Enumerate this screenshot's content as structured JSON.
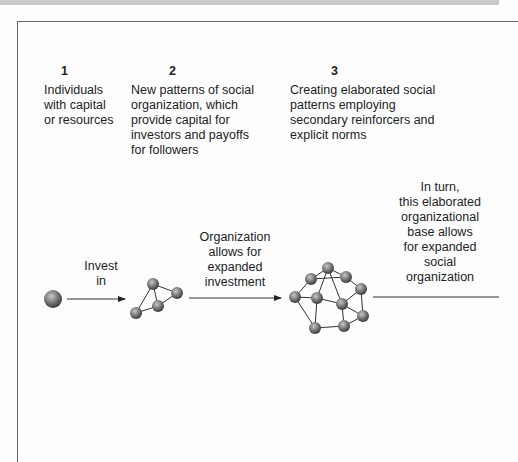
{
  "stages": [
    {
      "number": "1",
      "description": "Individuals with capital or resources",
      "lines": [
        "Individuals",
        "with capital",
        "or resources"
      ]
    },
    {
      "number": "2",
      "description": "New patterns of social organization, which provide capital for investors and payoffs for followers",
      "lines": [
        "New patterns of social",
        "organization, which",
        "provide capital for",
        "investors and payoffs",
        "for followers"
      ]
    },
    {
      "number": "3",
      "description": "Creating elaborated social patterns employing secondary reinforcers and explicit norms",
      "lines": [
        "Creating elaborated social",
        "patterns employing",
        "secondary reinforcers and",
        "explicit norms"
      ]
    }
  ],
  "arrows": [
    {
      "label_lines": [
        "Invest",
        "in"
      ]
    },
    {
      "label_lines": [
        "Organization",
        "allows for",
        "expanded",
        "investment"
      ]
    },
    {
      "label_lines": [
        "In turn,",
        "this elaborated",
        "organizational",
        "base allows",
        "for expanded",
        "social",
        "organization"
      ]
    }
  ],
  "colors": {
    "node": "#777777",
    "line": "#333333",
    "frame": "#666666",
    "band": "#c9c9c9"
  }
}
